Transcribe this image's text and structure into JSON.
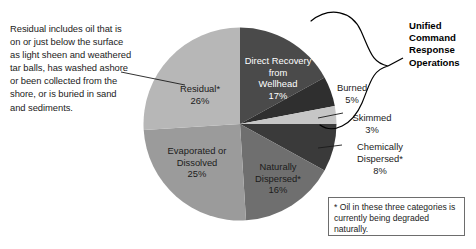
{
  "chart_data": {
    "type": "pie",
    "title": "",
    "categories": [
      "Direct Recovery from Wellhead",
      "Burned",
      "Skimmed",
      "Chemically Dispersed*",
      "Naturally Dispersed*",
      "Evaporated or Dissolved",
      "Residual*"
    ],
    "values": [
      17,
      5,
      3,
      8,
      16,
      25,
      26
    ],
    "value_suffix": "%",
    "start_angle_deg": 0,
    "direction": "clockwise",
    "legend": "none",
    "grid": false,
    "colors": [
      "#4a4a4a",
      "#2f2f2f",
      "#c6c6c6",
      "#3a3a3a",
      "#6f6f6f",
      "#9b9b9b",
      "#b7b7b7"
    ],
    "slices": [
      {
        "label": "Direct Recovery from Wellhead",
        "label_lines": [
          "Direct Recovery",
          "from",
          "Wellhead"
        ],
        "value": 17,
        "value_text": "17%",
        "color": "#4a4a4a",
        "label_placement": "inside"
      },
      {
        "label": "Burned",
        "label_lines": [
          "Burned"
        ],
        "value": 5,
        "value_text": "5%",
        "color": "#2f2f2f",
        "label_placement": "callout"
      },
      {
        "label": "Skimmed",
        "label_lines": [
          "Skimmed"
        ],
        "value": 3,
        "value_text": "3%",
        "color": "#c6c6c6",
        "label_placement": "callout"
      },
      {
        "label": "Chemically Dispersed*",
        "label_lines": [
          "Chemically",
          "Dispersed*"
        ],
        "value": 8,
        "value_text": "8%",
        "color": "#3a3a3a",
        "label_placement": "callout"
      },
      {
        "label": "Naturally Dispersed*",
        "label_lines": [
          "Naturally",
          "Dispersed*"
        ],
        "value": 16,
        "value_text": "16%",
        "color": "#6f6f6f",
        "label_placement": "inside"
      },
      {
        "label": "Evaporated or Dissolved",
        "label_lines": [
          "Evaporated or",
          "Dissolved"
        ],
        "value": 25,
        "value_text": "25%",
        "color": "#9b9b9b",
        "label_placement": "inside"
      },
      {
        "label": "Residual*",
        "label_lines": [
          "Residual*"
        ],
        "value": 26,
        "value_text": "26%",
        "color": "#b7b7b7",
        "label_placement": "inside"
      }
    ]
  },
  "annotations": {
    "residual_note": "Residual includes oil that is on or just below the surface as light sheen and weathered tar balls, has washed ashore or been collected from the shore, or is buried in sand and sediments.",
    "unified_heading": "Unified Command Response Operations",
    "footnote": "* Oil in these three categories is currently being degraded naturally."
  },
  "labels": {
    "residual": {
      "name": "Residual*",
      "value": "26%"
    },
    "direct_recovery": {
      "line1": "Direct Recovery",
      "line2": "from",
      "line3": "Wellhead",
      "value": "17%"
    },
    "evaporated": {
      "line1": "Evaporated or",
      "line2": "Dissolved",
      "value": "25%"
    },
    "naturally_dispersed": {
      "line1": "Naturally",
      "line2": "Dispersed*",
      "value": "16%"
    },
    "burned": {
      "name": "Burned",
      "value": "5%"
    },
    "skimmed": {
      "name": "Skimmed",
      "value": "3%"
    },
    "chemically_dispersed": {
      "line1": "Chemically",
      "line2": "Dispersed*",
      "value": "8%"
    }
  }
}
